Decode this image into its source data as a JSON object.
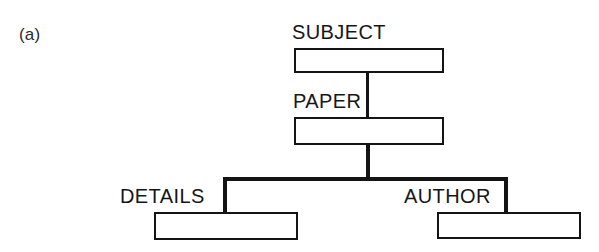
{
  "figure": {
    "part_label": "(a)",
    "type": "hierarchical-tree-diagram",
    "background_color": "#ffffff",
    "line_color": "#141414",
    "text_color": "#161616"
  },
  "nodes": {
    "root": {
      "label": "SUBJECT"
    },
    "level2": {
      "label": "PAPER"
    },
    "level3_left": {
      "label": "DETAILS"
    },
    "level3_right": {
      "label": "AUTHOR"
    }
  },
  "edges": [
    {
      "from": "SUBJECT",
      "to": "PAPER"
    },
    {
      "from": "PAPER",
      "to": "DETAILS"
    },
    {
      "from": "PAPER",
      "to": "AUTHOR"
    }
  ]
}
